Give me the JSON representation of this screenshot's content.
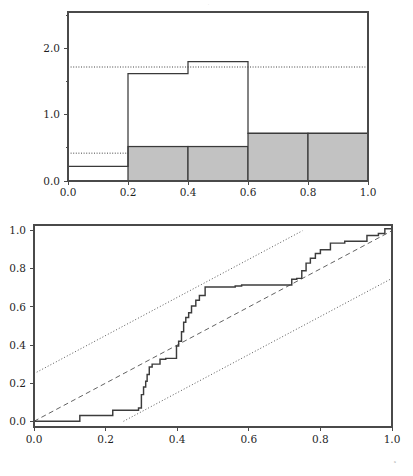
{
  "figure": {
    "background_color": "#ffffff",
    "width": 413,
    "height": 476,
    "top_micro_mark": "·",
    "bottom_micro_mark": "x"
  },
  "chart_data": [
    {
      "type": "bar",
      "name": "histogram-panel",
      "title": "",
      "subtitle": "",
      "xlabel": "",
      "ylabel": "",
      "xlim": [
        0.0,
        1.0
      ],
      "ylim": [
        0.0,
        2.55
      ],
      "grid": false,
      "legend": "none",
      "bin_edges": [
        0.0,
        0.2,
        0.4,
        0.6,
        0.8,
        1.0
      ],
      "categories": [
        "0.0-0.2",
        "0.2-0.4",
        "0.4-0.6",
        "0.6-0.8",
        "0.8-1.0"
      ],
      "series": [
        {
          "name": "empirical-histogram-outline",
          "style": "unfilled-outline",
          "fill": "none",
          "stroke": "#3a3a3a",
          "values": [
            0.22,
            1.62,
            1.8,
            0.72,
            0.72
          ]
        },
        {
          "name": "reference-histogram-shaded",
          "style": "gray-filled",
          "fill": "#c2c2c2",
          "stroke": "#3a3a3a",
          "values": [
            0.0,
            0.52,
            0.52,
            0.72,
            0.72
          ]
        }
      ],
      "reference_lines": [
        {
          "name": "upper-band",
          "orientation": "horizontal",
          "y": 1.72,
          "style": "dotted"
        },
        {
          "name": "lower-band",
          "orientation": "horizontal",
          "y": 0.42,
          "style": "dotted"
        }
      ],
      "xticks": [
        0.0,
        0.2,
        0.4,
        0.6,
        0.8,
        1.0
      ],
      "xticklabels": [
        "0.0",
        "0.2",
        "0.4",
        "0.6",
        "0.8",
        "1.0"
      ],
      "yticks": [
        0.0,
        1.0,
        2.0
      ],
      "yticklabels": [
        "0.0",
        "1.0",
        "2.0"
      ],
      "yminorticks": [
        0.5,
        1.5,
        2.0,
        2.5
      ]
    },
    {
      "type": "line",
      "name": "ecdf-panel",
      "title": "",
      "subtitle": "",
      "xlabel": "x",
      "ylabel": "",
      "xlim": [
        0.0,
        1.0
      ],
      "ylim": [
        -0.03,
        1.03
      ],
      "grid": false,
      "legend": "none",
      "xticks": [
        0.0,
        0.2,
        0.4,
        0.6,
        0.8,
        1.0
      ],
      "xticklabels": [
        "0.0",
        "0.2",
        "0.4",
        "0.6",
        "0.8",
        "1.0"
      ],
      "yticks": [
        0.0,
        0.2,
        0.4,
        0.6,
        0.8,
        1.0
      ],
      "yticklabels": [
        "0.0",
        "0.2",
        "0.4",
        "0.6",
        "0.8",
        "1.0"
      ],
      "series": [
        {
          "name": "empirical-cdf-step",
          "style": "step",
          "stroke": "#3c3c3c",
          "x": [
            0.0,
            0.128,
            0.128,
            0.22,
            0.22,
            0.292,
            0.292,
            0.3,
            0.3,
            0.306,
            0.306,
            0.312,
            0.312,
            0.316,
            0.316,
            0.322,
            0.322,
            0.33,
            0.33,
            0.352,
            0.352,
            0.368,
            0.368,
            0.398,
            0.398,
            0.404,
            0.404,
            0.412,
            0.412,
            0.418,
            0.418,
            0.424,
            0.424,
            0.432,
            0.432,
            0.44,
            0.44,
            0.452,
            0.452,
            0.462,
            0.462,
            0.478,
            0.478,
            0.562,
            0.562,
            0.58,
            0.58,
            0.72,
            0.72,
            0.734,
            0.734,
            0.748,
            0.748,
            0.76,
            0.76,
            0.772,
            0.772,
            0.786,
            0.786,
            0.8,
            0.8,
            0.828,
            0.828,
            0.868,
            0.868,
            0.93,
            0.93,
            0.962,
            0.962,
            0.98,
            0.98,
            1.0
          ],
          "y": [
            0.0,
            0.0,
            0.03,
            0.03,
            0.058,
            0.058,
            0.07,
            0.07,
            0.14,
            0.14,
            0.18,
            0.18,
            0.21,
            0.21,
            0.245,
            0.245,
            0.285,
            0.285,
            0.3,
            0.3,
            0.325,
            0.325,
            0.33,
            0.33,
            0.395,
            0.395,
            0.42,
            0.42,
            0.47,
            0.47,
            0.52,
            0.52,
            0.545,
            0.545,
            0.57,
            0.57,
            0.605,
            0.605,
            0.635,
            0.635,
            0.66,
            0.66,
            0.705,
            0.705,
            0.71,
            0.71,
            0.715,
            0.715,
            0.745,
            0.745,
            0.75,
            0.75,
            0.79,
            0.79,
            0.83,
            0.83,
            0.855,
            0.855,
            0.88,
            0.88,
            0.9,
            0.9,
            0.935,
            0.935,
            0.945,
            0.945,
            0.975,
            0.975,
            0.985,
            0.985,
            1.01,
            1.01
          ]
        },
        {
          "name": "uniform-reference-diagonal",
          "style": "dashed",
          "stroke": "#5a5a5a",
          "x": [
            0.0,
            1.0
          ],
          "y": [
            0.0,
            1.0
          ]
        },
        {
          "name": "upper-confidence-band",
          "style": "dotted",
          "stroke": "#3a3a3a",
          "offset": 0.25,
          "x": [
            0.0,
            0.75
          ],
          "y": [
            0.25,
            1.0
          ]
        },
        {
          "name": "lower-confidence-band",
          "style": "dotted",
          "stroke": "#3a3a3a",
          "offset": -0.25,
          "x": [
            0.25,
            1.0
          ],
          "y": [
            0.0,
            0.75
          ]
        }
      ]
    }
  ]
}
